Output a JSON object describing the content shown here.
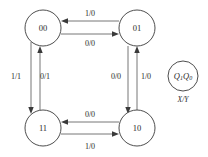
{
  "diagram": {
    "type": "finite-state-machine",
    "title": "",
    "states": [
      {
        "id": "s00",
        "label": "00",
        "cx": 43,
        "cy": 28,
        "r": 18
      },
      {
        "id": "s01",
        "label": "01",
        "cx": 137,
        "cy": 28,
        "r": 18
      },
      {
        "id": "s11",
        "label": "11",
        "cx": 43,
        "cy": 128,
        "r": 18
      },
      {
        "id": "s10",
        "label": "10",
        "cx": 137,
        "cy": 128,
        "r": 18
      }
    ],
    "transitions": [
      {
        "id": "t01_00",
        "from": "01",
        "to": "00",
        "label": "1/0",
        "side": "top",
        "position": "outer",
        "label_x": 90,
        "label_y": 13
      },
      {
        "id": "t00_01",
        "from": "00",
        "to": "01",
        "label": "0/0",
        "side": "top",
        "position": "inner",
        "label_x": 90,
        "label_y": 43
      },
      {
        "id": "t00_11",
        "from": "00",
        "to": "11",
        "label": "1/1",
        "side": "left",
        "position": "outer",
        "label_x": 16,
        "label_y": 76
      },
      {
        "id": "t11_00",
        "from": "11",
        "to": "00",
        "label": "0/1",
        "side": "left",
        "position": "inner",
        "label_x": 45,
        "label_y": 76
      },
      {
        "id": "t01_10",
        "from": "01",
        "to": "10",
        "label": "0/0",
        "side": "right",
        "position": "inner",
        "label_x": 116,
        "label_y": 76
      },
      {
        "id": "t10_01",
        "from": "10",
        "to": "01",
        "label": "1/0",
        "side": "right",
        "position": "outer",
        "label_x": 146,
        "label_y": 76
      },
      {
        "id": "t10_11",
        "from": "10",
        "to": "11",
        "label": "0/0",
        "side": "bottom",
        "position": "inner",
        "label_x": 90,
        "label_y": 114
      },
      {
        "id": "t11_10",
        "from": "11",
        "to": "10",
        "label": "1/0",
        "side": "bottom",
        "position": "outer",
        "label_x": 90,
        "label_y": 146
      }
    ],
    "legend": {
      "state_code_main": "Q",
      "state_code_sub1": "1",
      "state_code_sub2": "Q",
      "state_code_sub3": "0",
      "state_code_full": "Q1Q0",
      "io_label": "X/Y",
      "cx": 183,
      "cy": 76,
      "r": 15
    },
    "colors": {
      "background": "#ffffff",
      "stroke": "#3a3a3a",
      "edge": "#4a4a4a",
      "text": "#2b2b2b"
    }
  }
}
